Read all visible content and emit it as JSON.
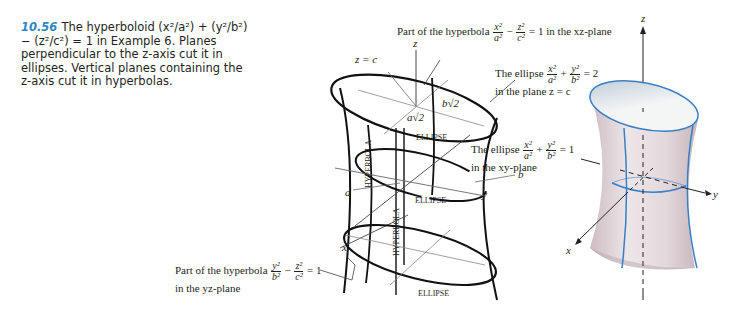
{
  "caption": {
    "number": "10.56",
    "text": "The hyperboloid (x²/a²) + (y²/b²) − (z²/c²) = 1 in Example 6. Planes perpendicular to the z-axis cut it in ellipses. Vertical planes containing the z-axis cut it in hyperbolas.",
    "number_color": "#2e86c1"
  },
  "left_figure": {
    "annotations": {
      "xz_hyperbola": {
        "prefix": "Part of the hyperbola",
        "f1_num": "x²",
        "f1_den": "a²",
        "op": "−",
        "f2_num": "z²",
        "f2_den": "c²",
        "suffix": "= 1 in the xz-plane"
      },
      "ellipse_top": {
        "prefix": "The ellipse",
        "f1_num": "x²",
        "f1_den": "a²",
        "op": "+",
        "f2_num": "y²",
        "f2_den": "b²",
        "suffix": "= 2",
        "line2": "in the plane z = c"
      },
      "ellipse_mid": {
        "prefix": "The ellipse",
        "f1_num": "x²",
        "f1_den": "a²",
        "op": "+",
        "f2_num": "y²",
        "f2_den": "b²",
        "suffix": "= 1",
        "line2": "in the xy-plane"
      },
      "yz_hyperbola": {
        "prefix": "Part of the hyperbola",
        "f1_num": "y²",
        "f1_den": "b²",
        "op": "−",
        "f2_num": "z²",
        "f2_den": "c²",
        "suffix": "= 1",
        "line2": "in the yz-plane"
      }
    },
    "labels": {
      "z_axis": "z",
      "z_eq_c": "z = c",
      "b_sqrt2": "b√2",
      "a_sqrt2": "a√2",
      "ellipse": "ELLIPSE",
      "hyperbola": "HYPERBOLA",
      "a": "a",
      "b": "b",
      "y_axis": "y",
      "x_axis": "x"
    }
  },
  "right_figure": {
    "labels": {
      "z_axis": "z",
      "y_axis": "y",
      "x_axis": "x"
    },
    "colors": {
      "surface": "#e6dde0",
      "surface_shade": "#c9b9bf",
      "trace": "#3a7fc4",
      "inner": "#f2f3f3"
    }
  }
}
